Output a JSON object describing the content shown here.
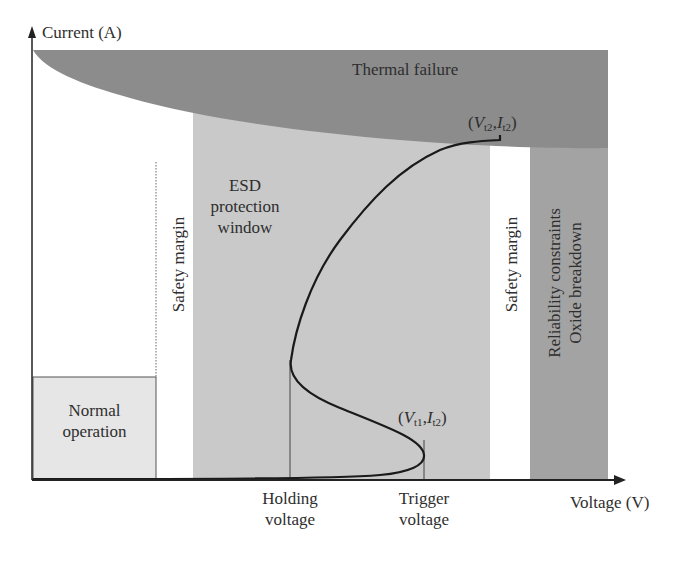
{
  "axes": {
    "y_label": "Current (A)",
    "x_label": "Voltage (V)"
  },
  "regions": {
    "thermal_failure": "Thermal failure",
    "esd_window": [
      "ESD",
      "protection",
      "window"
    ],
    "safety_margin_left": "Safety margin",
    "safety_margin_right": "Safety margin",
    "reliability": [
      "Reliability constraints",
      "Oxide breakdown"
    ],
    "normal_operation": [
      "Normal",
      "operation"
    ]
  },
  "points": {
    "top": {
      "open": "(",
      "V": "V",
      "V_sub": "t2",
      "sep": ",",
      "I": "I",
      "I_sub": "t2",
      "close": ")"
    },
    "trigger": {
      "open": "(",
      "V": "V",
      "V_sub": "t1",
      "sep": ",",
      "I": "I",
      "I_sub": "t2",
      "close": ")"
    }
  },
  "x_ticks": {
    "holding": [
      "Holding",
      "voltage"
    ],
    "trigger": [
      "Trigger",
      "voltage"
    ]
  },
  "colors": {
    "thermal": "#8c8c8c",
    "esd_window": "#c9c9c9",
    "reliability": "#a3a3a3",
    "normal": "#e6e6e6",
    "curve": "#1a1a1a"
  }
}
